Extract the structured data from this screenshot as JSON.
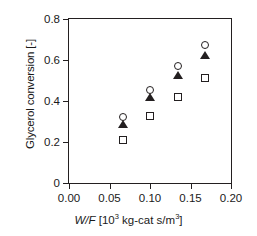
{
  "chart_data": {
    "type": "scatter",
    "title": "",
    "xlabel": "W/F [10^3 kg-cat s/m^3]",
    "xlabel_parts": {
      "symbol": "W/F",
      "open": " [10",
      "exp1": "3",
      "mid": " kg-cat s/m",
      "exp2": "3",
      "close": "]"
    },
    "ylabel": "Glycerol conversion [-]",
    "xlim": [
      0.0,
      0.2
    ],
    "ylim": [
      0.0,
      0.8
    ],
    "grid": false,
    "legend": "none",
    "xticks": [
      0.0,
      0.05,
      0.1,
      0.15,
      0.2
    ],
    "xtick_labels": [
      "0.00",
      "0.05",
      "0.10",
      "0.15",
      "0.20"
    ],
    "yticks": [
      0.0,
      0.2,
      0.4,
      0.6,
      0.8
    ],
    "ytick_labels": [
      "0",
      "0.2",
      "0.4",
      "0.6",
      "0.8"
    ],
    "x": [
      0.067,
      0.1,
      0.135,
      0.168
    ],
    "series": [
      {
        "name": "open-circle",
        "marker": "circle",
        "fill": "open",
        "color": "#231f20",
        "values": [
          0.32,
          0.455,
          0.57,
          0.675
        ]
      },
      {
        "name": "filled-triangle",
        "marker": "triangle",
        "fill": "filled",
        "color": "#231f20",
        "values": [
          0.29,
          0.42,
          0.525,
          0.625
        ]
      },
      {
        "name": "open-square",
        "marker": "square",
        "fill": "open",
        "color": "#231f20",
        "values": [
          0.21,
          0.325,
          0.42,
          0.51
        ]
      }
    ]
  }
}
